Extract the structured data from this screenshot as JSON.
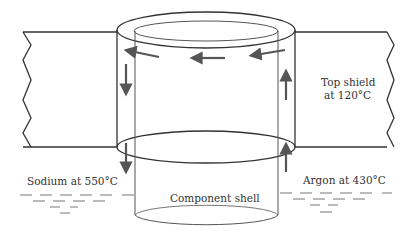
{
  "diagram": {
    "labels": {
      "top_shield_line1": "Top shield",
      "top_shield_line2": "at 120°C",
      "sodium": "Sodium at 550°C",
      "argon": "Argon at 430°C",
      "component_shell": "Component shell"
    },
    "colors": {
      "line": "#333333",
      "arrow": "#555555",
      "text": "#333333"
    }
  }
}
